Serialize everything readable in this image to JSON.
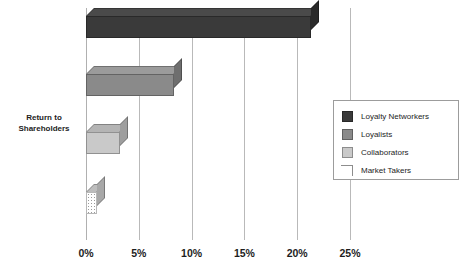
{
  "chart_data": {
    "type": "bar",
    "orientation": "horizontal",
    "title": "",
    "xlabel": "",
    "ylabel": "Return to Shareholders",
    "categories": [
      "Return to Shareholders"
    ],
    "xlim": [
      0,
      25
    ],
    "xticks": [
      0,
      5,
      10,
      15,
      20,
      25
    ],
    "xticklabels": [
      "0%",
      "5%",
      "10%",
      "15%",
      "20%",
      "25%"
    ],
    "grid": true,
    "legend_position": "center-right",
    "value_suffix": "%",
    "series": [
      {
        "name": "Loyalty Networkers",
        "value": 21.3,
        "color": "#3a3a3a",
        "top_color": "#4a4a4a",
        "side_color": "#2a2a2a",
        "texture": "solid"
      },
      {
        "name": "Loyalists",
        "value": 8.3,
        "color": "#8a8a8a",
        "top_color": "#9b9b9b",
        "side_color": "#6e6e6e",
        "texture": "solid"
      },
      {
        "name": "Collaborators",
        "value": 3.2,
        "color": "#c9c9c9",
        "top_color": "#b4b4b4",
        "side_color": "#9e9e9e",
        "texture": "solid"
      },
      {
        "name": "Market Takers",
        "value": 1.0,
        "color": "#ffffff",
        "top_color": "#bdbdbd",
        "side_color": "#a8a8a8",
        "texture": "dots"
      }
    ]
  },
  "axis": {
    "ylabel_line1": "Return to",
    "ylabel_line2": "Shareholders"
  },
  "legend": {
    "items": [
      {
        "label": "Loyalty Networkers"
      },
      {
        "label": "Loyalists"
      },
      {
        "label": "Collaborators"
      },
      {
        "label": "Market Takers"
      }
    ]
  },
  "colors": {
    "gridline": "#b9b9b9",
    "legend_border": "#9c9c9c",
    "text": "#1d1d1d",
    "background": "#ffffff"
  }
}
